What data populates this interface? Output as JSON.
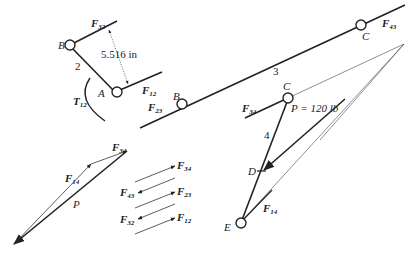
{
  "diagram": {
    "links": {
      "link2": {
        "number": "2",
        "pin_B": "B",
        "pin_A": "A",
        "dimension": "5.516 in",
        "torque": "T",
        "torque_sub": "12"
      },
      "link3": {
        "number": "3",
        "pin_B": "B",
        "pin_C": "C"
      },
      "link4": {
        "number": "4",
        "pin_C": "C",
        "pin_D": "D",
        "pin_E": "E"
      }
    },
    "forces": {
      "F32": {
        "main": "F",
        "sub": "32"
      },
      "F12": {
        "main": "F",
        "sub": "12"
      },
      "F23": {
        "main": "F",
        "sub": "23"
      },
      "F43": {
        "main": "F",
        "sub": "43"
      },
      "F34": {
        "main": "F",
        "sub": "34"
      },
      "F14": {
        "main": "F",
        "sub": "14"
      }
    },
    "applied_load": {
      "label": "P = 120 lb",
      "symbol": "P"
    },
    "force_polygon": {
      "labels": [
        {
          "main": "F",
          "sub": "14"
        },
        {
          "main": "F",
          "sub": "34"
        },
        {
          "main": "P",
          "sub": ""
        }
      ]
    },
    "direction_legend": [
      {
        "main": "F",
        "sub": "34"
      },
      {
        "main": "F",
        "sub": "43"
      },
      {
        "main": "F",
        "sub": "23"
      },
      {
        "main": "F",
        "sub": "32"
      },
      {
        "main": "F",
        "sub": "12"
      }
    ]
  }
}
